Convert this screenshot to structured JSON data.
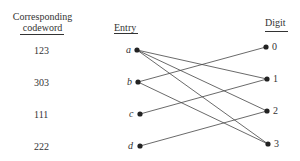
{
  "headers": {
    "codeword_line1": "Corresponding",
    "codeword_line2": "codeword",
    "entry": "Entry",
    "digit": "Digit"
  },
  "rows": [
    {
      "codeword": "123",
      "entry": "a"
    },
    {
      "codeword": "303",
      "entry": "b"
    },
    {
      "codeword": "111",
      "entry": "c"
    },
    {
      "codeword": "222",
      "entry": "d"
    }
  ],
  "digits": [
    "0",
    "1",
    "2",
    "3"
  ],
  "edges": [
    {
      "from": "a",
      "to": "1"
    },
    {
      "from": "a",
      "to": "2"
    },
    {
      "from": "a",
      "to": "3"
    },
    {
      "from": "b",
      "to": "0"
    },
    {
      "from": "b",
      "to": "3"
    },
    {
      "from": "c",
      "to": "1"
    },
    {
      "from": "d",
      "to": "2"
    }
  ]
}
